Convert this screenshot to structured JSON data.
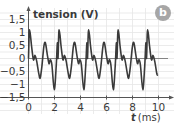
{
  "chart_data": {
    "type": "line",
    "title": "",
    "badge": "b",
    "ylabel": "tension (V)",
    "xlabel_var": "t",
    "xlabel_unit": "(ms)",
    "xlim": [
      0,
      10.5
    ],
    "ylim": [
      -1.5,
      1.7
    ],
    "x_ticks": [
      0,
      2,
      4,
      6,
      8,
      10
    ],
    "x_tick_labels": [
      "0",
      "2",
      "4",
      "6",
      "8",
      "10"
    ],
    "y_ticks": [
      1.5,
      1,
      0.5,
      0,
      -0.5,
      -1,
      -1.5
    ],
    "y_tick_labels": [
      "1,5",
      "1",
      "0,5",
      "0",
      "−0,5",
      "−1",
      "−1,5"
    ],
    "grid": true,
    "period_ms": 2.27,
    "period_shape": [
      [
        0.0,
        0.0
      ],
      [
        0.05,
        0.9
      ],
      [
        0.08,
        1.1
      ],
      [
        0.15,
        0.9
      ],
      [
        0.23,
        0.5
      ],
      [
        0.38,
        -0.05
      ],
      [
        0.5,
        0.12
      ],
      [
        0.63,
        -0.1
      ],
      [
        0.8,
        -0.6
      ],
      [
        0.9,
        -0.75
      ],
      [
        1.03,
        -0.3
      ],
      [
        1.18,
        0.45
      ],
      [
        1.3,
        0.6
      ],
      [
        1.46,
        0.1
      ],
      [
        1.58,
        -0.2
      ],
      [
        1.68,
        -0.05
      ],
      [
        1.8,
        -0.25
      ],
      [
        1.98,
        -1.2
      ],
      [
        2.13,
        -0.3
      ],
      [
        2.22,
        0.6
      ]
    ],
    "end_t": 9.95,
    "series": [
      {
        "name": "tension",
        "color": "#3a3a3a"
      }
    ],
    "colors": {
      "grid": "#e6e6e6",
      "axis": "#555555",
      "text": "#3a3a3a",
      "badge": "#a6a6a6"
    }
  }
}
